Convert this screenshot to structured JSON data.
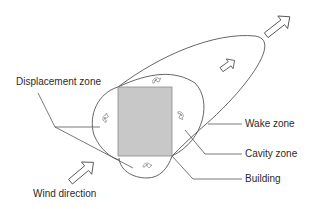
{
  "diagram": {
    "type": "airflow around building",
    "labels": {
      "displacement_zone": "Displacement zone",
      "wake_zone": "Wake zone",
      "cavity_zone": "Cavity zone",
      "building": "Building",
      "wind_direction": "Wind direction"
    },
    "colors": {
      "line": "#555555",
      "building_fill": "#c8c8c8",
      "building_stroke": "#8a8a8a",
      "text": "#2a2a2a",
      "background": "#ffffff"
    },
    "elements": [
      "building",
      "cavity-zone-circle",
      "wake-zone-ellipse",
      "wind-direction-arrow",
      "outflow-arrow",
      "wake-flow-arrow",
      "recirculation-arrows"
    ]
  }
}
